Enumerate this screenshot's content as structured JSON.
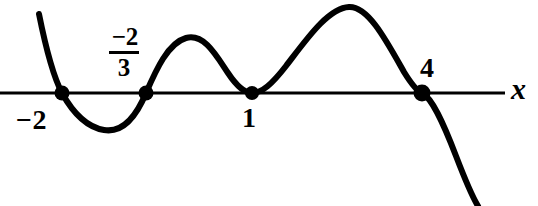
{
  "figure": {
    "background_color": "#ffffff",
    "ink_color": "#000000",
    "width": 538,
    "height": 206
  },
  "axis": {
    "name": "x",
    "label": "x",
    "y_pixel": 93,
    "x_start_pixel": 0,
    "x_end_pixel": 505,
    "stroke_width": 3
  },
  "labels": {
    "root_neg_two": "−2",
    "root_neg_two_thirds_numerator": "−2",
    "root_neg_two_thirds_denominator": "3",
    "root_one": "1",
    "root_four": "4",
    "axis_x": "x"
  },
  "chart_data": {
    "type": "line",
    "title": "",
    "subtitle": "",
    "xlabel": "x",
    "ylabel": "",
    "grid": false,
    "legend": "none",
    "axis_shown": [
      "x"
    ],
    "x_intercepts": [
      {
        "label": "−2",
        "value": -2,
        "behavior": "crosses",
        "multiplicity": "odd",
        "pixel_x": 62,
        "marked": true
      },
      {
        "label": "−2/3",
        "value": -0.6667,
        "behavior": "crosses",
        "multiplicity": "odd",
        "pixel_x": 146,
        "marked": true
      },
      {
        "label": "1",
        "value": 1,
        "behavior": "touches",
        "multiplicity": "even",
        "pixel_x": 252,
        "marked": true
      },
      {
        "label": "4",
        "value": 4,
        "behavior": "crosses",
        "multiplicity": "odd",
        "pixel_x": 422,
        "marked": true
      }
    ],
    "turning_points": [
      {
        "kind": "local-minimum",
        "pixel_x": 104,
        "pixel_y": 130
      },
      {
        "kind": "local-maximum",
        "pixel_x": 186,
        "pixel_y": 38
      },
      {
        "kind": "local-minimum",
        "pixel_x": 252,
        "pixel_y": 93
      },
      {
        "kind": "local-maximum",
        "pixel_x": 349,
        "pixel_y": 7
      }
    ],
    "end_behavior": {
      "left": "rises to +infinity",
      "right": "falls to -infinity"
    },
    "curve_path": "M 39,14 C 45,44 52,74 62,93 C 73,113 86,127 104,130 C 122,133 136,117 146,93 C 156,70 168,43 186,38 C 204,33 216,55 228,73 C 238,88 245,93 252,93 C 262,93 272,84 286,66 C 306,40 328,8 349,7 C 368,6 386,40 404,72 C 412,85 417,91 422,93 C 432,98 443,122 456,156 C 466,182 473,198 478,206",
    "curve_stroke_width": 6,
    "marker_radius": 7,
    "marker_style": "filled-circle"
  }
}
